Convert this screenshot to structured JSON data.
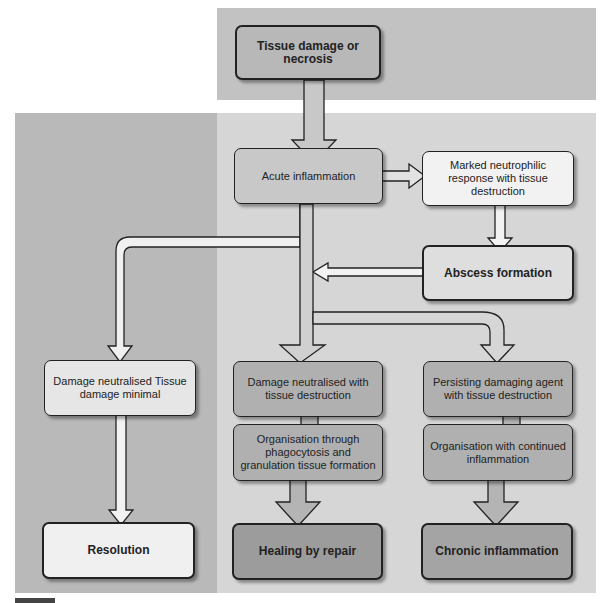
{
  "diagram": {
    "colors": {
      "top_panel": "#c2c2c2",
      "main_panel": "#d6d6d6",
      "left_region": "#b9b9b9",
      "box_dark": "#a8a8a8",
      "box_mid": "#c4c4c4",
      "box_light": "#e8e8e8",
      "box_white": "#f5f5f5"
    },
    "nodes": {
      "tissue_damage": "Tissue damage or necrosis",
      "acute_inflammation": "Acute inflammation",
      "neutrophilic": "Marked neutrophilic response with tissue destruction",
      "abscess": "Abscess formation",
      "damage_minimal": "Damage neutralised Tissue damage minimal",
      "damage_destruction": "Damage neutralised with tissue destruction",
      "organisation_phagocytosis": "Organisation through phagocytosis and granulation tissue formation",
      "persisting_agent": "Persisting damaging agent with tissue destruction",
      "organisation_continued": "Organisation with continued inflammation",
      "resolution": "Resolution",
      "healing": "Healing by repair",
      "chronic": "Chronic inflammation"
    },
    "edges": [
      [
        "tissue_damage",
        "acute_inflammation"
      ],
      [
        "acute_inflammation",
        "neutrophilic"
      ],
      [
        "neutrophilic",
        "abscess"
      ],
      [
        "abscess",
        "acute_inflammation"
      ],
      [
        "acute_inflammation",
        "damage_minimal"
      ],
      [
        "acute_inflammation",
        "damage_destruction"
      ],
      [
        "acute_inflammation",
        "persisting_agent"
      ],
      [
        "damage_minimal",
        "resolution"
      ],
      [
        "damage_destruction",
        "organisation_phagocytosis"
      ],
      [
        "organisation_phagocytosis",
        "healing"
      ],
      [
        "persisting_agent",
        "organisation_continued"
      ],
      [
        "organisation_continued",
        "chronic"
      ]
    ]
  }
}
